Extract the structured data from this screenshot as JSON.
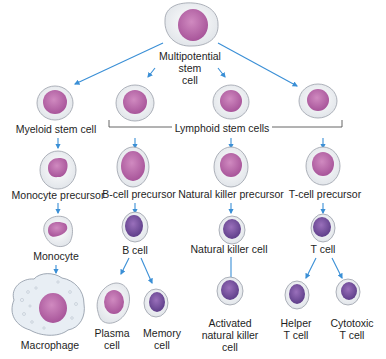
{
  "colors": {
    "arrow": "#3a8fd6",
    "cytoplasm": "#eef0f2",
    "cell_outline": "#9aa0aa",
    "nucleus_light": "#b86aa8",
    "nucleus_dark": "#7a4f9e",
    "bracket": "#555555"
  },
  "nodes": {
    "multipotential": {
      "label": "Multipotential\nstem\ncell",
      "lines": [
        "Multipotential",
        "stem",
        "cell"
      ]
    },
    "myeloid": {
      "label": "Myeloid stem cell"
    },
    "lymphoid_group": {
      "label": "Lymphoid stem cells"
    },
    "monocyte_precursor": {
      "label": "Monocyte precursor"
    },
    "monocyte": {
      "label": "Monocyte"
    },
    "macrophage": {
      "label": "Macrophage"
    },
    "b_precursor": {
      "label": "B-cell precursor"
    },
    "b_cell": {
      "label": "B cell"
    },
    "plasma": {
      "lines": [
        "Plasma",
        "cell"
      ]
    },
    "memory": {
      "lines": [
        "Memory",
        "cell"
      ]
    },
    "nk_precursor": {
      "label": "Natural killer precursor"
    },
    "nk_cell": {
      "label": "Natural killer cell"
    },
    "activated_nk": {
      "lines": [
        "Activated",
        "natural killer",
        "cell"
      ]
    },
    "t_precursor": {
      "label": "T-cell precursor"
    },
    "t_cell": {
      "label": "T cell"
    },
    "helper": {
      "lines": [
        "Helper",
        "T cell"
      ]
    },
    "cytotoxic": {
      "lines": [
        "Cytotoxic",
        "T cell"
      ]
    }
  }
}
